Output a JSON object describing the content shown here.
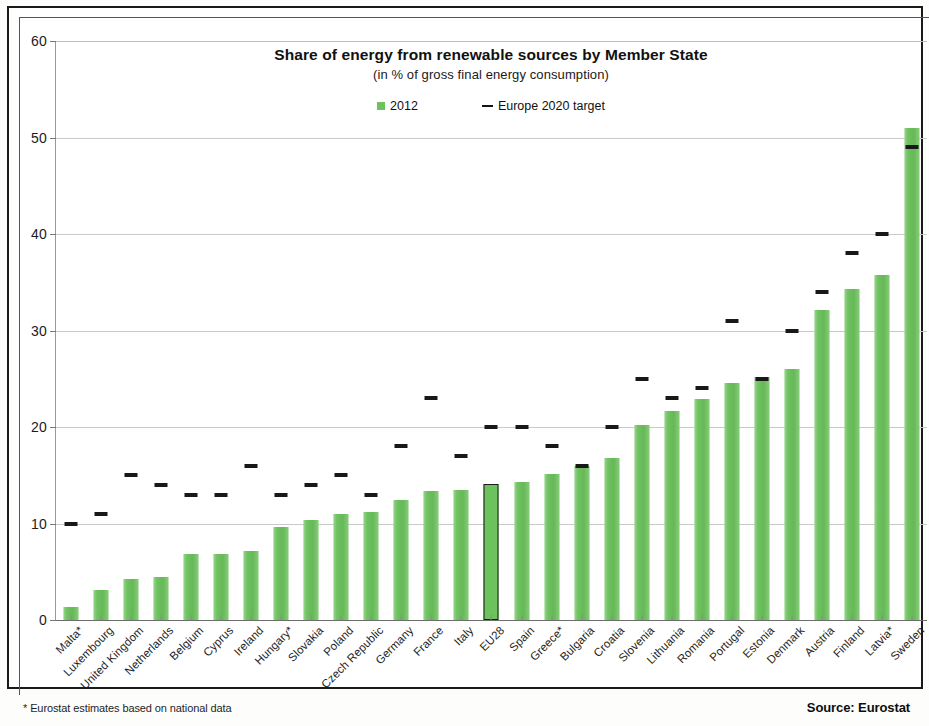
{
  "footer": {
    "footnote": "* Eurostat estimates based on national data",
    "source": "Source: Eurostat"
  },
  "chart_data": {
    "type": "bar",
    "title": "Share of energy from renewable sources by Member State",
    "subtitle": "(in % of gross final energy consumption)",
    "xlabel": "",
    "ylabel": "",
    "ylim": [
      0,
      60
    ],
    "yticks": [
      0,
      10,
      20,
      30,
      40,
      50,
      60
    ],
    "grid": true,
    "legend_position": "top-center",
    "legend": [
      {
        "name": "2012",
        "marker": "square",
        "color": "#6cc25d"
      },
      {
        "name": "Europe 2020 target",
        "marker": "dash",
        "color": "#151515"
      }
    ],
    "highlight_category": "EU28",
    "categories": [
      "Malta*",
      "Luxembourg",
      "United Kingdom",
      "Netherlands",
      "Belgium",
      "Cyprus",
      "Ireland",
      "Hungary*",
      "Slovakia",
      "Poland",
      "Czech Republic",
      "Germany",
      "France",
      "Italy",
      "EU28",
      "Spain",
      "Greece*",
      "Bulgaria",
      "Croatia",
      "Slovenia",
      "Lithuania",
      "Romania",
      "Portugal",
      "Estonia",
      "Denmark",
      "Austria",
      "Finland",
      "Latvia*",
      "Sweden"
    ],
    "series": [
      {
        "name": "2012",
        "values": [
          1.4,
          3.1,
          4.2,
          4.5,
          6.8,
          6.8,
          7.2,
          9.6,
          10.4,
          11.0,
          11.2,
          12.4,
          13.4,
          13.5,
          14.1,
          14.3,
          15.1,
          16.0,
          16.8,
          20.2,
          21.7,
          22.9,
          24.6,
          25.2,
          26.0,
          32.1,
          34.3,
          35.8,
          51.0
        ]
      },
      {
        "name": "Europe 2020 target",
        "values": [
          10.0,
          11.0,
          15.0,
          14.0,
          13.0,
          13.0,
          16.0,
          13.0,
          14.0,
          15.0,
          13.0,
          18.0,
          23.0,
          17.0,
          20.0,
          20.0,
          18.0,
          16.0,
          20.0,
          25.0,
          23.0,
          24.0,
          31.0,
          25.0,
          30.0,
          34.0,
          38.0,
          40.0,
          49.0
        ]
      }
    ]
  }
}
